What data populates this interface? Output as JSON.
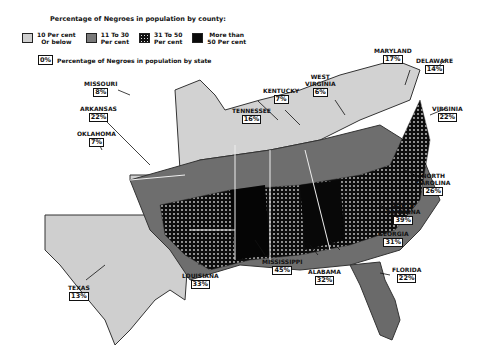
{
  "legend": {
    "title": "Percentage of Negroes in population by county:",
    "items": [
      {
        "label": "10 Per cent\nOr below",
        "color": "#cfcfcf"
      },
      {
        "label": "11 To 30\nPer cent",
        "color": "#7a7a7a"
      },
      {
        "label": "31 To 50\nPer cent",
        "color": "#111111"
      },
      {
        "label": "More than\n50 Per cent",
        "color": "#0a0a0a"
      }
    ],
    "state_box": "0%",
    "state_text": "Percentage of Negroes in population by state"
  },
  "states": [
    {
      "name": "MARYLAND",
      "pct": "17%"
    },
    {
      "name": "DELAWARE",
      "pct": "14%"
    },
    {
      "name": "MISSOURI",
      "pct": "8%"
    },
    {
      "name": "WEST\nVIRGINIA",
      "pct": "6%"
    },
    {
      "name": "KENTUCKY",
      "pct": "7%"
    },
    {
      "name": "ARKANSAS",
      "pct": "22%"
    },
    {
      "name": "TENNESSEE",
      "pct": "16%"
    },
    {
      "name": "VIRGINIA",
      "pct": "22%"
    },
    {
      "name": "OKLAHOMA",
      "pct": "7%"
    },
    {
      "name": "NORTH\nCAROLINA",
      "pct": "26%"
    },
    {
      "name": "SOUTH\nCAROLINA",
      "pct": "39%"
    },
    {
      "name": "GEORGIA",
      "pct": "31%"
    },
    {
      "name": "TEXAS",
      "pct": "13%"
    },
    {
      "name": "LOUISIANA",
      "pct": "33%"
    },
    {
      "name": "MISSISSIPPI",
      "pct": "45%"
    },
    {
      "name": "ALABAMA",
      "pct": "32%"
    },
    {
      "name": "FLORIDA",
      "pct": "22%"
    }
  ]
}
